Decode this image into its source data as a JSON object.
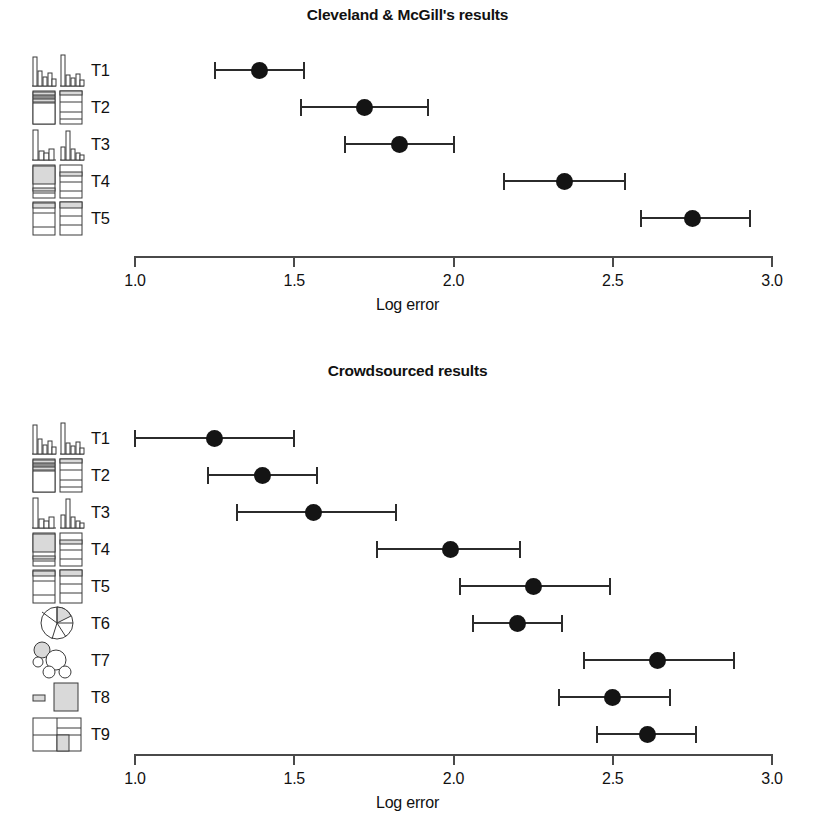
{
  "figure": {
    "axis_label": "Log error",
    "axis_min": 1.0,
    "axis_max": 3.0,
    "tick_labels": [
      "1.0",
      "1.5",
      "2.0",
      "2.5",
      "3.0"
    ],
    "marker_color": "#141414",
    "line_color": "#2b2b2b",
    "axis_color": "#4a4a4a",
    "background": "#ffffff",
    "icon_fill": "#d9d9d9"
  },
  "chart_data": [
    {
      "type": "scatter",
      "title": "Cleveland & McGill's results",
      "xlabel": "Log error",
      "ylabel": "",
      "xlim": [
        1.0,
        3.0
      ],
      "xticks": [
        1.0,
        1.5,
        2.0,
        2.5,
        3.0
      ],
      "grid": false,
      "legend": "none",
      "orientation": "horizontal-error-bars",
      "categories": [
        "T1",
        "T2",
        "T3",
        "T4",
        "T5"
      ],
      "series": [
        {
          "name": "Log error (mean with 95% CI)",
          "points": [
            {
              "category": "T1",
              "value": 1.39,
              "ci_low": 1.25,
              "ci_high": 1.53,
              "icon": "grouped-bar-chart-icon"
            },
            {
              "category": "T2",
              "value": 1.72,
              "ci_low": 1.52,
              "ci_high": 1.92,
              "icon": "stacked-bar-pair-icon"
            },
            {
              "category": "T3",
              "value": 1.83,
              "ci_low": 1.66,
              "ci_high": 2.0,
              "icon": "split-bar-chart-icon"
            },
            {
              "category": "T4",
              "value": 2.35,
              "ci_low": 2.16,
              "ci_high": 2.54,
              "icon": "stacked-bar-segments-icon"
            },
            {
              "category": "T5",
              "value": 2.75,
              "ci_low": 2.59,
              "ci_high": 2.93,
              "icon": "stacked-bar-wide-icon"
            }
          ]
        }
      ]
    },
    {
      "type": "scatter",
      "title": "Crowdsourced results",
      "xlabel": "Log error",
      "ylabel": "",
      "xlim": [
        1.0,
        3.0
      ],
      "xticks": [
        1.0,
        1.5,
        2.0,
        2.5,
        3.0
      ],
      "grid": false,
      "legend": "none",
      "orientation": "horizontal-error-bars",
      "categories": [
        "T1",
        "T2",
        "T3",
        "T4",
        "T5",
        "T6",
        "T7",
        "T8",
        "T9"
      ],
      "series": [
        {
          "name": "Log error (mean with 95% CI)",
          "points": [
            {
              "category": "T1",
              "value": 1.25,
              "ci_low": 1.0,
              "ci_high": 1.5,
              "icon": "grouped-bar-chart-icon"
            },
            {
              "category": "T2",
              "value": 1.4,
              "ci_low": 1.23,
              "ci_high": 1.57,
              "icon": "stacked-bar-pair-icon"
            },
            {
              "category": "T3",
              "value": 1.56,
              "ci_low": 1.32,
              "ci_high": 1.82,
              "icon": "split-bar-chart-icon"
            },
            {
              "category": "T4",
              "value": 1.99,
              "ci_low": 1.76,
              "ci_high": 2.21,
              "icon": "stacked-bar-segments-icon"
            },
            {
              "category": "T5",
              "value": 2.25,
              "ci_low": 2.02,
              "ci_high": 2.49,
              "icon": "stacked-bar-wide-icon"
            },
            {
              "category": "T6",
              "value": 2.2,
              "ci_low": 2.06,
              "ci_high": 2.34,
              "icon": "pie-chart-icon"
            },
            {
              "category": "T7",
              "value": 2.64,
              "ci_low": 2.41,
              "ci_high": 2.88,
              "icon": "bubble-chart-icon"
            },
            {
              "category": "T8",
              "value": 2.5,
              "ci_low": 2.33,
              "ci_high": 2.68,
              "icon": "rectangle-area-icon"
            },
            {
              "category": "T9",
              "value": 2.61,
              "ci_low": 2.45,
              "ci_high": 2.76,
              "icon": "treemap-icon"
            }
          ]
        }
      ]
    }
  ]
}
